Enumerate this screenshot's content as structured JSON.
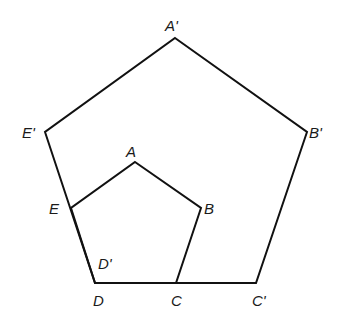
{
  "diagram": {
    "type": "geometry-dilation",
    "stroke_color": "#111111",
    "background": "#ffffff",
    "small_pentagon": {
      "name": "ABCDE",
      "vertices": [
        {
          "label": "A",
          "x": 135,
          "y": 162
        },
        {
          "label": "B",
          "x": 201,
          "y": 208
        },
        {
          "label": "C",
          "x": 176,
          "y": 283
        },
        {
          "label": "D",
          "x": 95,
          "y": 283
        },
        {
          "label": "E",
          "x": 71,
          "y": 208
        }
      ]
    },
    "large_pentagon": {
      "name": "A'B'C'D'E'",
      "vertices": [
        {
          "label": "A'",
          "x": 175,
          "y": 38
        },
        {
          "label": "B'",
          "x": 307,
          "y": 132
        },
        {
          "label": "C'",
          "x": 256,
          "y": 283
        },
        {
          "label": "D'",
          "x": 95,
          "y": 283
        },
        {
          "label": "E'",
          "x": 45,
          "y": 132
        }
      ]
    },
    "labels": {
      "A_prime": "A'",
      "B_prime": "B'",
      "C_prime": "C'",
      "D_prime": "D'",
      "E_prime": "E'",
      "A": "A",
      "B": "B",
      "C": "C",
      "D": "D",
      "E": "E"
    }
  }
}
